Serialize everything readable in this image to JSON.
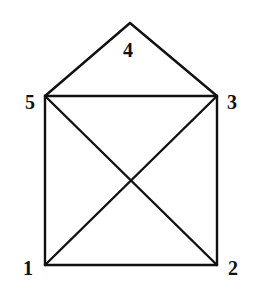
{
  "diagram": {
    "type": "graph",
    "colors": {
      "stroke": "#111111",
      "background": "#ffffff"
    },
    "nodes": [
      {
        "id": "1",
        "label": "1",
        "x": 45,
        "y": 265,
        "lx": 28,
        "ly": 275
      },
      {
        "id": "2",
        "label": "2",
        "x": 217,
        "y": 265,
        "lx": 233,
        "ly": 275
      },
      {
        "id": "3",
        "label": "3",
        "x": 217,
        "y": 96,
        "lx": 232,
        "ly": 109
      },
      {
        "id": "4",
        "label": "4",
        "x": 130,
        "y": 23,
        "lx": 128,
        "ly": 57
      },
      {
        "id": "5",
        "label": "5",
        "x": 45,
        "y": 96,
        "lx": 30,
        "ly": 109
      }
    ],
    "edges": [
      {
        "from": "1",
        "to": "2"
      },
      {
        "from": "2",
        "to": "3"
      },
      {
        "from": "3",
        "to": "5"
      },
      {
        "from": "5",
        "to": "1"
      },
      {
        "from": "1",
        "to": "3"
      },
      {
        "from": "2",
        "to": "5"
      },
      {
        "from": "5",
        "to": "4"
      },
      {
        "from": "4",
        "to": "3"
      }
    ]
  }
}
